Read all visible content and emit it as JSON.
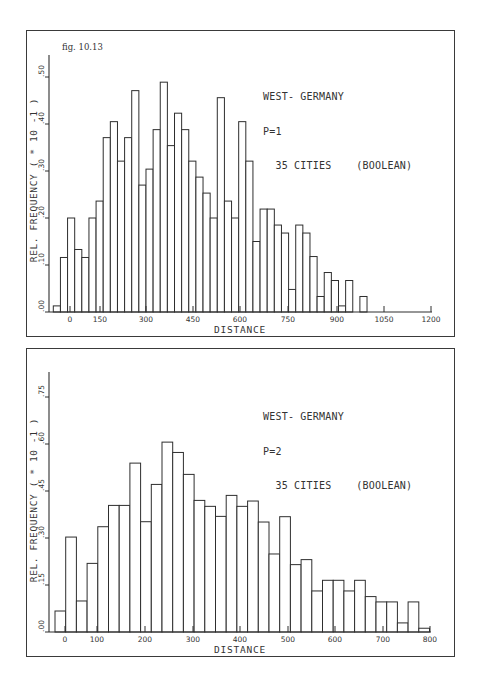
{
  "figure_label": "fig. 10.13",
  "chart_data": [
    {
      "type": "bar",
      "title": "WEST-GERMANY",
      "annotation_lines": [
        "WEST- GERMANY",
        "P=1",
        "  35 CITIES    (BOOLEAN)"
      ],
      "xlabel": "DISTANCE",
      "ylabel": "REL. FREQUENCY ( * 10  -1 )",
      "x_ticks": [
        0,
        150,
        300,
        450,
        600,
        750,
        900,
        1050,
        1200
      ],
      "x_tick_labels": [
        "0",
        "150",
        "300",
        "450",
        "600",
        "750",
        "900",
        "1050",
        "1200"
      ],
      "y_ticks": [
        0,
        0.1,
        0.2,
        0.3,
        0.4,
        0.5
      ],
      "y_tick_labels": [
        ".00",
        ".10",
        ".20",
        ".30",
        ".40",
        ".50"
      ],
      "xlim": [
        -110,
        1200
      ],
      "ylim": [
        0,
        0.55
      ],
      "bin_start": -95,
      "bin_width": 22.5,
      "values": [
        0.013,
        0.116,
        0.2,
        0.133,
        0.116,
        0.2,
        0.236,
        0.371,
        0.405,
        0.321,
        0.371,
        0.471,
        0.27,
        0.304,
        0.388,
        0.489,
        0.354,
        0.423,
        0.388,
        0.321,
        0.287,
        0.253,
        0.2,
        0.456,
        0.236,
        0.2,
        0.405,
        0.321,
        0.15,
        0.219,
        0.219,
        0.185,
        0.168,
        0.048,
        0.185,
        0.168,
        0.118,
        0.033,
        0.084,
        0.067,
        0.013,
        0.067,
        0.0,
        0.033
      ],
      "grid": false
    },
    {
      "type": "bar",
      "title": "WEST-GERMANY",
      "annotation_lines": [
        "WEST- GERMANY",
        "P=2",
        "  35 CITIES    (BOOLEAN)"
      ],
      "xlabel": "DISTANCE",
      "ylabel": "REL. FREQUENCY ( * 10  -1 )",
      "x_ticks": [
        0,
        100,
        200,
        300,
        400,
        500,
        600,
        700,
        800
      ],
      "x_tick_labels": [
        "0",
        "100",
        "200",
        "300",
        "400",
        "500",
        "600",
        "700",
        "800"
      ],
      "y_ticks": [
        0,
        0.15,
        0.3,
        0.45,
        0.6,
        0.75
      ],
      "y_tick_labels": [
        ".00",
        ".15",
        ".30",
        ".45",
        ".60",
        ".75"
      ],
      "xlim": [
        -30,
        800
      ],
      "ylim": [
        0,
        0.82
      ],
      "bin_start": -23,
      "bin_width": 22.6,
      "values": [
        0.067,
        0.303,
        0.099,
        0.219,
        0.336,
        0.404,
        0.404,
        0.539,
        0.352,
        0.471,
        0.606,
        0.573,
        0.503,
        0.42,
        0.401,
        0.369,
        0.436,
        0.401,
        0.418,
        0.351,
        0.249,
        0.368,
        0.215,
        0.231,
        0.131,
        0.165,
        0.165,
        0.131,
        0.165,
        0.113,
        0.096,
        0.096,
        0.029,
        0.096,
        0.012
      ],
      "grid": false
    }
  ]
}
